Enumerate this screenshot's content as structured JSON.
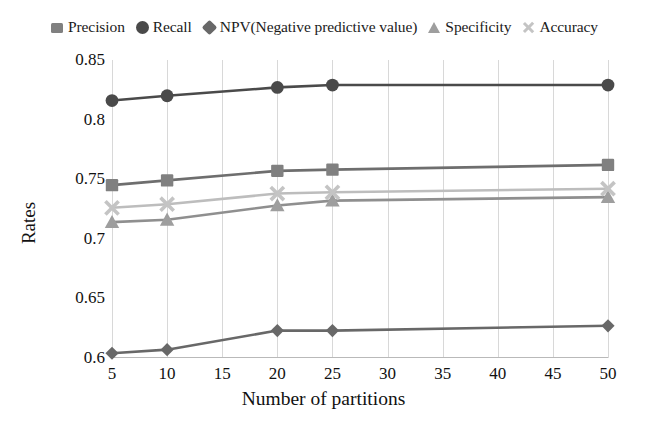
{
  "chart_data": {
    "type": "line",
    "title": "",
    "subtitle": "",
    "xlabel": "Number of partitions",
    "ylabel": "Rates",
    "x": [
      5,
      10,
      20,
      25,
      50
    ],
    "xticks": [
      5,
      10,
      15,
      20,
      25,
      30,
      35,
      40,
      45,
      50
    ],
    "yticks": [
      0.6,
      0.65,
      0.7,
      0.75,
      0.8,
      0.85
    ],
    "ytick_labels": [
      "0.6",
      "0.65",
      "0.7",
      "0.75",
      "0.8",
      "0.85"
    ],
    "xlim": [
      5,
      50
    ],
    "ylim": [
      0.6,
      0.85
    ],
    "grid": "vertical",
    "legend_position": "top",
    "series": [
      {
        "name": "Precision",
        "marker": "square",
        "color": "#808080",
        "line_color": "#6e6e6e",
        "values": [
          0.745,
          0.749,
          0.757,
          0.758,
          0.762
        ]
      },
      {
        "name": "Recall",
        "marker": "circle",
        "color": "#4a4a4a",
        "line_color": "#4a4a4a",
        "values": [
          0.816,
          0.82,
          0.827,
          0.829,
          0.829
        ]
      },
      {
        "name": "NPV(Negative predictive value)",
        "marker": "diamond",
        "color": "#686868",
        "line_color": "#686868",
        "values": [
          0.604,
          0.607,
          0.623,
          0.623,
          0.627
        ]
      },
      {
        "name": "Specificity",
        "marker": "triangle",
        "color": "#9e9e9e",
        "line_color": "#8f8f8f",
        "values": [
          0.714,
          0.716,
          0.728,
          0.732,
          0.735
        ]
      },
      {
        "name": "Accuracy",
        "marker": "x",
        "color": "#c4c4c4",
        "line_color": "#bdbdbd",
        "values": [
          0.726,
          0.729,
          0.738,
          0.739,
          0.742
        ]
      }
    ]
  }
}
